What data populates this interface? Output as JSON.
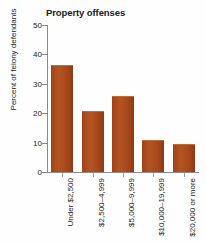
{
  "chart_data": {
    "type": "bar",
    "title": "Property offenses",
    "xlabel": "",
    "ylabel": "Percent of felony defendants",
    "categories": [
      "Under $2,500",
      "$2,500–4,999",
      "$5,000–9,999",
      "$10,000–19,999",
      "$20,000 or more"
    ],
    "values": [
      36,
      20.3,
      25.4,
      10.4,
      9.3
    ],
    "ylim": [
      0,
      50
    ],
    "yticks": [
      0,
      10,
      20,
      30,
      40,
      50
    ],
    "ytick_labels": [
      "0",
      "10",
      "20",
      "30",
      "40",
      "50"
    ],
    "grid": false,
    "legend": null,
    "bar_color": "#a8481c",
    "axis_color": "#8a8a8a"
  }
}
